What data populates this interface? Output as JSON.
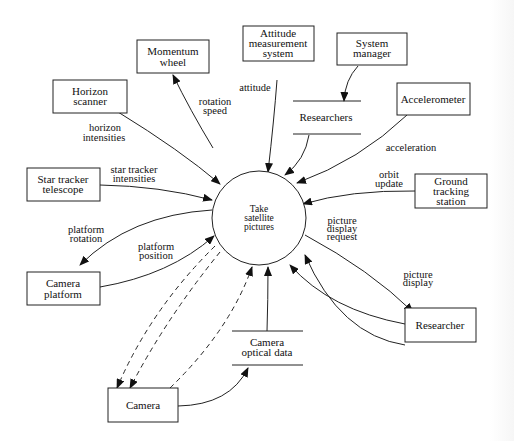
{
  "diagram": {
    "type": "data-flow-diagram",
    "process": {
      "label_lines": [
        "Take",
        "satellite",
        "pictures"
      ]
    },
    "externals": {
      "momentum_wheel": [
        "Momentum",
        "wheel"
      ],
      "attitude_system": [
        "Attitude",
        "measurement",
        "system"
      ],
      "system_manager": [
        "System",
        "manager"
      ],
      "horizon_scanner": [
        "Horizon",
        "scanner"
      ],
      "accelerometer": [
        "Accelerometer"
      ],
      "star_tracker": [
        "Star tracker",
        "telescope"
      ],
      "ground_station": [
        "Ground",
        "tracking",
        "station"
      ],
      "camera_platform": [
        "Camera",
        "platform"
      ],
      "researcher": [
        "Researcher"
      ],
      "camera": [
        "Camera"
      ]
    },
    "stores": {
      "researchers": "Researchers",
      "camera_optical_data": [
        "Camera",
        "optical data"
      ]
    },
    "flows": {
      "rotation_speed": [
        "rotation",
        "speed"
      ],
      "attitude": "attitude",
      "horizon_intensities": [
        "horizon",
        "intensities"
      ],
      "acceleration": "acceleration",
      "star_tracker_intensities": [
        "star tracker",
        "intensities"
      ],
      "orbit_update": [
        "orbit",
        "update"
      ],
      "platform_rotation": [
        "platform",
        "rotation"
      ],
      "platform_position": [
        "platform",
        "position"
      ],
      "picture_display_request": [
        "picture",
        "display",
        "request"
      ],
      "picture_display": [
        "picture",
        "display"
      ],
      "shutter_closed": [
        "shutter",
        "closed"
      ],
      "filter_required": [
        "filter",
        "required"
      ],
      "open_shutter": [
        "open",
        "shutter"
      ],
      "picture_taking_request": [
        "picture",
        "taking",
        "request"
      ]
    },
    "numbers": {
      "momentum": "3,5",
      "attitude": "3,4",
      "horizon": "5",
      "researchers_store": "2",
      "star_tracker": "5",
      "picture_display": "2",
      "picture_taking": "1"
    }
  }
}
